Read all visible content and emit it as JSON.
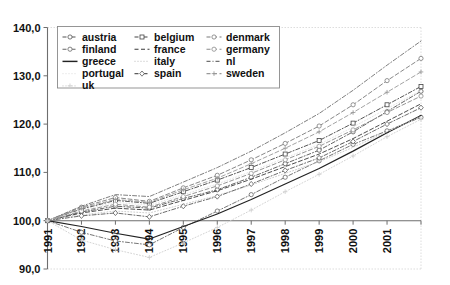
{
  "chart_data": {
    "type": "line",
    "title": "",
    "subtitle": "",
    "xlabel": "",
    "ylabel": "",
    "grid": false,
    "legend_position": "top-left-inside",
    "x": [
      1991,
      1992,
      1993,
      1994,
      1995,
      1996,
      1997,
      1998,
      1999,
      2000,
      2001,
      2002
    ],
    "xtick_labels": [
      "1991",
      "1992",
      "1993",
      "1994",
      "1995",
      "1996",
      "1997",
      "1998",
      "1999",
      "2000",
      "2001"
    ],
    "ytick_labels": [
      "90,0",
      "100,0",
      "110,0",
      "120,0",
      "130,0",
      "140,0"
    ],
    "ytick_values": [
      90,
      100,
      110,
      120,
      130,
      140
    ],
    "ylim": [
      90,
      140
    ],
    "xlim": [
      1991,
      2002
    ],
    "series": [
      {
        "name": "austria",
        "marker": "circle",
        "dash": "dashdot",
        "color": "#555555",
        "width": 0.9,
        "values": [
          100.0,
          101.8,
          103.0,
          102.6,
          104.6,
          106.4,
          109.0,
          111.8,
          114.6,
          118.4,
          122.6,
          126.8
        ]
      },
      {
        "name": "belgium",
        "marker": "square",
        "dash": "dashdot",
        "color": "#444444",
        "width": 0.9,
        "values": [
          100.0,
          102.4,
          104.2,
          103.6,
          106.0,
          108.4,
          111.0,
          113.8,
          116.6,
          120.2,
          124.0,
          127.8
        ]
      },
      {
        "name": "denmark",
        "marker": "circle",
        "dash": "dash",
        "color": "#7a7a7a",
        "width": 0.9,
        "values": [
          100.0,
          102.8,
          104.8,
          104.0,
          106.8,
          109.4,
          112.6,
          116.0,
          119.6,
          124.0,
          129.0,
          133.6
        ]
      },
      {
        "name": "finland",
        "marker": "circle",
        "dash": "dashdot",
        "color": "#666666",
        "width": 0.9,
        "values": [
          100.0,
          97.6,
          95.8,
          95.0,
          98.6,
          102.0,
          105.4,
          109.0,
          112.4,
          115.8,
          118.6,
          121.4
        ]
      },
      {
        "name": "france",
        "marker": "none",
        "dash": "dash",
        "color": "#3a3a3a",
        "width": 0.9,
        "values": [
          100.0,
          101.6,
          102.6,
          102.2,
          104.2,
          106.2,
          108.6,
          111.2,
          113.8,
          117.0,
          120.6,
          124.2
        ]
      },
      {
        "name": "germany",
        "marker": "circle",
        "dash": "dash",
        "color": "#8a8a8a",
        "width": 0.9,
        "values": [
          100.0,
          102.0,
          103.4,
          102.8,
          105.0,
          107.2,
          109.8,
          112.6,
          115.4,
          118.8,
          122.4,
          125.8
        ]
      },
      {
        "name": "greece",
        "marker": "none",
        "dash": "solid",
        "color": "#222222",
        "width": 1.2,
        "values": [
          100.0,
          98.8,
          97.4,
          96.2,
          98.8,
          101.4,
          104.4,
          107.6,
          110.8,
          114.4,
          118.2,
          121.8
        ]
      },
      {
        "name": "italy",
        "marker": "none",
        "dash": "dot",
        "color": "#c8c8c8",
        "width": 0.9,
        "values": [
          100.0,
          101.2,
          102.0,
          101.6,
          103.4,
          105.2,
          107.4,
          109.8,
          112.2,
          115.2,
          118.4,
          121.6
        ]
      },
      {
        "name": "nl",
        "marker": "none",
        "dash": "dashdot",
        "color": "#707070",
        "width": 0.9,
        "values": [
          100.0,
          103.0,
          105.4,
          105.0,
          108.0,
          111.0,
          114.4,
          118.2,
          122.2,
          127.0,
          132.2,
          137.2
        ]
      },
      {
        "name": "portugal",
        "marker": "none",
        "dash": "dot",
        "color": "#e2e2e2",
        "width": 0.9,
        "values": [
          100.0,
          102.2,
          103.8,
          103.2,
          105.4,
          107.6,
          110.2,
          113.0,
          115.8,
          119.4,
          123.2,
          127.0
        ]
      },
      {
        "name": "spain",
        "marker": "diamond",
        "dash": "dashdot",
        "color": "#5c5c5c",
        "width": 0.9,
        "values": [
          100.0,
          101.0,
          101.6,
          100.8,
          103.0,
          105.0,
          107.6,
          110.4,
          113.0,
          116.4,
          120.0,
          123.4
        ]
      },
      {
        "name": "sweden",
        "marker": "plus",
        "dash": "dash",
        "color": "#999999",
        "width": 0.9,
        "values": [
          100.0,
          102.6,
          104.4,
          103.8,
          106.4,
          108.8,
          111.8,
          115.0,
          118.4,
          122.4,
          126.6,
          130.8
        ]
      },
      {
        "name": "uk",
        "marker": "plus",
        "dash": "dot",
        "color": "#cfcfcf",
        "width": 0.9,
        "values": [
          100.0,
          96.0,
          94.0,
          92.4,
          95.4,
          98.6,
          102.2,
          106.0,
          109.6,
          113.4,
          117.4,
          121.0
        ]
      }
    ]
  },
  "legend": {
    "columns": [
      [
        "austria",
        "finland",
        "greece",
        "portugal",
        "uk"
      ],
      [
        "belgium",
        "france",
        "italy",
        "spain"
      ],
      [
        "denmark",
        "germany",
        "nl",
        "sweden"
      ]
    ]
  },
  "caption": {
    "text": ""
  }
}
